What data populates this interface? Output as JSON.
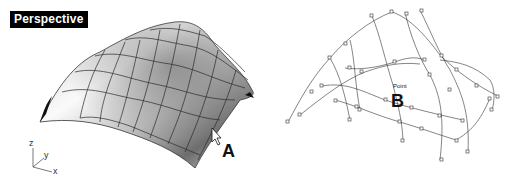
{
  "viewport": {
    "label": "Perspective"
  },
  "axes": {
    "z": "z",
    "y": "y",
    "x": "x"
  },
  "callouts": {
    "a": "A",
    "b": "B",
    "point_tooltip": "Point"
  },
  "colors": {
    "label_bg": "#000000",
    "label_fg": "#ffffff",
    "line": "#222222",
    "surface_light": "#f2f2f2",
    "surface_dark": "#6e6e6e"
  },
  "panels": [
    {
      "name": "rendered-surface",
      "description": "Shaded NURBS surface with isocurves"
    },
    {
      "name": "control-point-cage",
      "description": "Control points and polygon wireframe"
    }
  ]
}
